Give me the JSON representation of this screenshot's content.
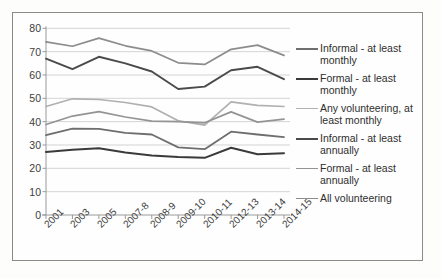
{
  "chart_data": {
    "type": "line",
    "title": "",
    "xlabel": "",
    "ylabel": "",
    "ylim": [
      0,
      80
    ],
    "yticks": [
      0,
      10,
      20,
      30,
      40,
      50,
      60,
      70,
      80
    ],
    "grid": true,
    "legend_position": "right",
    "categories": [
      "2001",
      "2003",
      "2005",
      "2007-8",
      "2008-9",
      "2009-10",
      "2010-11",
      "2012-13",
      "2013-14",
      "2014-15"
    ],
    "series": [
      {
        "name": "Any volunteering, at least annually",
        "legend_key": "any-volunteering-annually",
        "color": "#8c8c8c",
        "width": 1.7,
        "values": [
          74.2,
          72.3,
          75.8,
          72.5,
          70.3,
          65.2,
          64.5,
          71.0,
          72.8,
          68.4
        ]
      },
      {
        "name": "Formal - at least annually",
        "legend_key": "formal-annually",
        "color": "#4a4a4a",
        "width": 1.9,
        "values": [
          67.0,
          62.5,
          67.8,
          65.0,
          61.5,
          54.0,
          55.0,
          62.0,
          63.5,
          58.2
        ]
      },
      {
        "name": "Informal - at least annually",
        "legend_key": "informal-annually",
        "color": "#b0b0b0",
        "width": 1.7,
        "values": [
          46.5,
          49.8,
          49.5,
          48.2,
          46.3,
          40.4,
          38.5,
          48.5,
          47.0,
          46.5
        ]
      },
      {
        "name": "All volunteering",
        "legend_key": "all-volunteering",
        "color": "#949494",
        "width": 1.7,
        "values": [
          38.8,
          42.4,
          44.3,
          42.0,
          40.2,
          40.0,
          39.5,
          44.2,
          39.8,
          41.1
        ]
      },
      {
        "name": "Informal - at least monthly",
        "legend_key": "informal-monthly",
        "color": "#6e6e6e",
        "width": 1.8,
        "values": [
          34.2,
          37.0,
          36.9,
          35.2,
          34.5,
          29.0,
          28.2,
          35.7,
          34.5,
          33.4
        ]
      },
      {
        "name": "Formal - at least monthly",
        "legend_key": "formal-monthly",
        "color": "#3a3a3a",
        "width": 2.0,
        "values": [
          27.0,
          28.0,
          28.6,
          26.8,
          25.5,
          24.8,
          24.5,
          28.8,
          26.0,
          26.5
        ]
      }
    ]
  },
  "legend": {
    "items": [
      {
        "label": "Informal - at least monthly",
        "color": "#6e6e6e",
        "width": 2.0
      },
      {
        "label": "Formal - at least monthly",
        "color": "#3a3a3a",
        "width": 2.4
      },
      {
        "label": "Any volunteering, at least monthly",
        "color": "#b0b0b0",
        "width": 1.8
      },
      {
        "label": "Informal - at least annually",
        "color": "#4a4a4a",
        "width": 2.3
      },
      {
        "label": "Formal - at least annually",
        "color": "#949494",
        "width": 1.8
      },
      {
        "label": "All volunteering",
        "color": "#8c8c8c",
        "width": 1.8
      }
    ]
  },
  "style": {
    "grid_color": "#c9c9c9",
    "axis_color": "#9a9a9a",
    "border_color": "#8b8b86",
    "text_color": "#3d3d3d",
    "background": "#fefefe"
  }
}
